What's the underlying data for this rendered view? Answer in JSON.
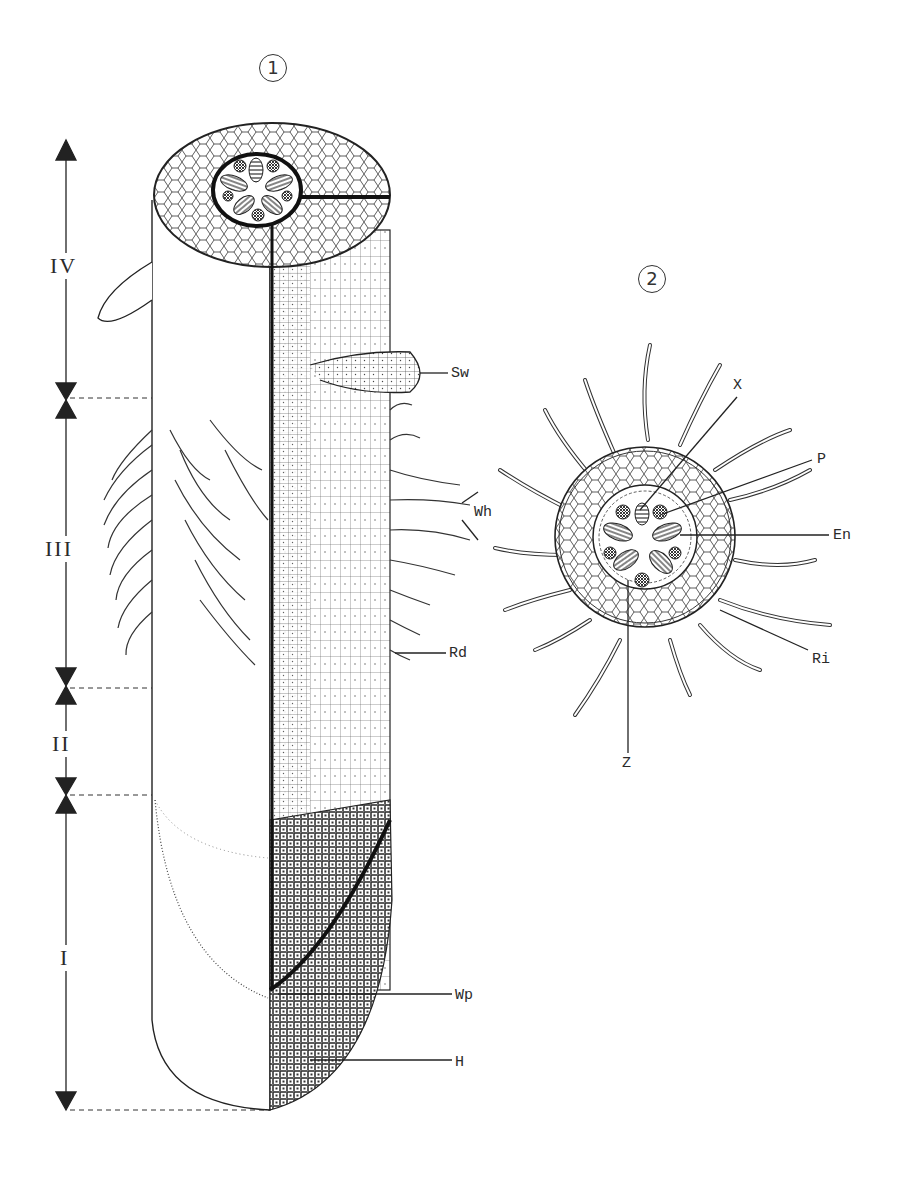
{
  "figures": [
    {
      "id": "1",
      "label": "1",
      "description": "Longitudinal view of root with cut-away showing tissue zones"
    },
    {
      "id": "2",
      "label": "2",
      "description": "Transverse cross-section of root in root-hair zone"
    }
  ],
  "zones": [
    {
      "label": "IV"
    },
    {
      "label": "III"
    },
    {
      "label": "II"
    },
    {
      "label": "I"
    }
  ],
  "figure1_labels": {
    "sw": "Sw",
    "wh": "Wh",
    "rd": "Rd",
    "wp": "Wp",
    "h": "H"
  },
  "figure2_labels": {
    "x": "X",
    "p": "P",
    "en": "En",
    "ri": "Ri",
    "z": "Z"
  },
  "colors": {
    "ink": "#2a2a2a",
    "background": "#ffffff"
  }
}
